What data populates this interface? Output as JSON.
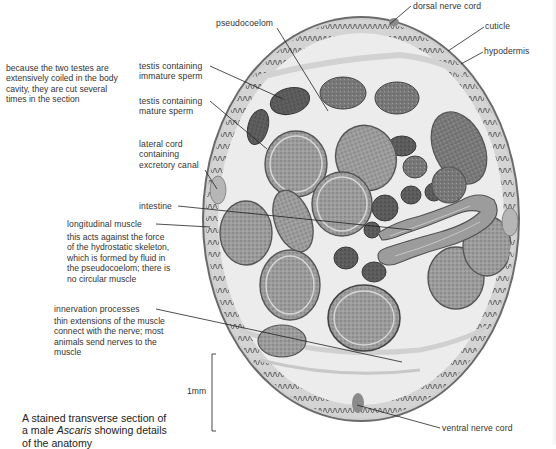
{
  "figure": {
    "caption": {
      "part1": "A stained transverse section of",
      "part2a": "a male ",
      "part2_italic": "Ascaris",
      "part2b": " showing details",
      "part3": "of the anatomy"
    },
    "scale_bar": {
      "label": "1mm"
    },
    "colors": {
      "cuticle": "#5c5c5c",
      "hypodermis": "#8a8a8a",
      "pseudocoelom": "#ececec",
      "testis_immature": "#4a4a4a",
      "testis_mature": "#8d8d8d",
      "intestine": "#9a9a9a",
      "lateral_cord": "#b3b3b3",
      "leader_line": "#222222"
    }
  },
  "labels": {
    "pseudocoelom": "pseudocoelom",
    "dorsal_nerve_cord": "dorsal nerve cord",
    "cuticle": "cuticle",
    "hypodermis": "hypodermis",
    "testis_immature_1": "testis containing",
    "testis_immature_2": "immature sperm",
    "testis_mature_1": "testis containing",
    "testis_mature_2": "mature sperm",
    "lateral_cord_1": "lateral cord",
    "lateral_cord_2": "containing",
    "lateral_cord_3": "excretory canal",
    "intestine": "intestine",
    "longitudinal_muscle": "longitudinal muscle",
    "innervation_processes": "innervation processes",
    "ventral_nerve_cord": "ventral nerve cord"
  },
  "notes": {
    "testes": [
      "because the two testes are",
      "extensively coiled in the body",
      "cavity, they are cut several",
      "times in the section"
    ],
    "muscle": [
      "this acts against the force",
      "of the hydrostatic skeleton,",
      "which is formed by fluid in",
      "the pseudocoelom; there is",
      "no circular muscle"
    ],
    "innervation": [
      "thin extensions of the muscle",
      "connect with the nerve; most",
      "animals send nerves to the",
      "muscle"
    ]
  }
}
